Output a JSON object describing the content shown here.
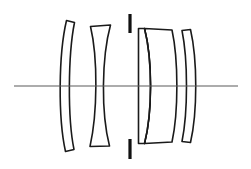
{
  "figure": {
    "title": "Photographic objective lens cross-section",
    "kind": "optical-layout-diagram",
    "width_px": 251,
    "height_px": 169,
    "background_color": "#ffffff",
    "ink_color": "#1a1a1a",
    "axis_color": "#5a5a5a"
  },
  "optical_axis": {
    "name": "optical-axis",
    "y": 86,
    "x_start": 14,
    "x_end": 238,
    "color": "#5a5a5a",
    "stroke_width": 1.1
  },
  "aperture_stop": {
    "name": "aperture-stop",
    "label": "aperture stop",
    "x": 130,
    "color": "#111111",
    "stroke_width": 3.2,
    "upper_blade": {
      "y_top": 14,
      "y_bottom": 33
    },
    "lower_blade": {
      "y_top": 139,
      "y_bottom": 159
    }
  },
  "groups": [
    {
      "name": "front-group",
      "elements": [
        1,
        2
      ]
    },
    {
      "name": "rear-group",
      "elements": [
        3,
        4,
        5
      ]
    }
  ],
  "elements": [
    {
      "index": 1,
      "name": "lens-element-1",
      "shape": "meniscus",
      "description": "front positive meniscus, convex toward object",
      "x_center": 70,
      "top_y": 20,
      "bottom_y": 152,
      "path": "M 66.5 20.5 L 74.5 22.5 C 68.0 55.0 67.5 118.0 74.0 149.5 L 65.5 151.5 C 58.0 118.0 58.5 54.0 66.5 20.5 Z"
    },
    {
      "index": 2,
      "name": "lens-element-2",
      "shape": "meniscus",
      "description": "second meniscus, concave toward object",
      "x_center": 100,
      "top_y": 25,
      "bottom_y": 147,
      "path": "M 90.5 26.5 L 110.5 25.0 C 101.5 58.0 101.0 113.0 109.5 146.0 L 90.0 146.5 C 97.5 113.0 98.0 58.0 90.5 26.5 Z"
    },
    {
      "index": 3,
      "name": "lens-element-3",
      "shape": "plano-convex-cemented-front",
      "description": "cemented doublet front member, flat object side",
      "x_center": 145,
      "top_y": 28,
      "bottom_y": 144,
      "path": "M 138.5 28.5 L 144.5 28.5 C 152.5 60.0 152.5 112.0 144.5 143.5 L 138.5 143.5 Z"
    },
    {
      "index": 4,
      "name": "lens-element-4",
      "shape": "biconvex-cemented-rear",
      "description": "cemented doublet rear member, thick biconvex",
      "x_center": 160,
      "top_y": 28,
      "bottom_y": 144,
      "path": "M 144.5 28.5 L 172.0 30.0 C 178.5 60.0 178.5 112.0 172.0 142.0 L 144.5 143.5 C 152.5 112.0 152.5 60.0 144.5 28.5 Z"
    },
    {
      "index": 5,
      "name": "lens-element-5",
      "shape": "meniscus",
      "description": "rear meniscus, convex toward image",
      "x_center": 190,
      "top_y": 29,
      "bottom_y": 143,
      "path": "M 182.0 30.5 L 190.5 29.5 C 197.5 60.0 197.5 112.0 190.5 142.5 L 182.0 141.5 C 188.0 112.0 188.0 60.0 182.0 30.5 Z"
    }
  ],
  "cement_surfaces": [
    {
      "name": "cement-surface-3-4",
      "between": [
        3,
        4
      ],
      "path": "M 144.5 28.5 C 152.5 60.0 152.5 112.0 144.5 143.5"
    }
  ]
}
